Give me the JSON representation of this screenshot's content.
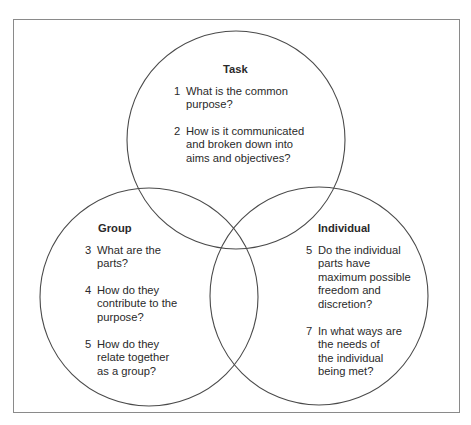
{
  "diagram": {
    "type": "venn",
    "line_color": "#4a4a4a",
    "frame_color": "#8a8a8a",
    "circles": [
      {
        "id": "task",
        "title": "Task",
        "items": [
          {
            "num": "1",
            "text": "What is the common\npurpose?"
          },
          {
            "num": "2",
            "text": "How is it communicated\nand broken down into\naims and objectives?"
          }
        ]
      },
      {
        "id": "group",
        "title": "Group",
        "items": [
          {
            "num": "3",
            "text": "What are the\nparts?"
          },
          {
            "num": "4",
            "text": "How do they\ncontribute to the\npurpose?"
          },
          {
            "num": "5",
            "text": "How do they\nrelate together\nas a group?"
          }
        ]
      },
      {
        "id": "individual",
        "title": "Individual",
        "items": [
          {
            "num": "5",
            "text": "Do the individual\nparts have\nmaximum possible\nfreedom and\ndiscretion?"
          },
          {
            "num": "7",
            "text": "In what ways are\nthe needs of\nthe individual\nbeing met?"
          }
        ]
      }
    ]
  }
}
